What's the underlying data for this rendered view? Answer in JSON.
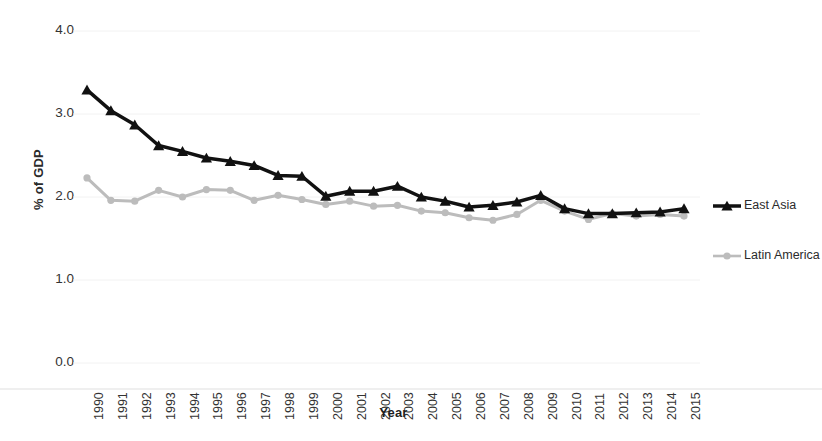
{
  "chart_data": {
    "type": "line",
    "title": "",
    "subtitle": "",
    "xlabel": "Year",
    "ylabel": "% of GDP",
    "xlim": [
      1990,
      2015
    ],
    "ylim": [
      0.0,
      4.0
    ],
    "grid": true,
    "grid_axis": "y",
    "legend_position": "right",
    "y_ticks": [
      "0.0",
      "1.0",
      "2.0",
      "3.0",
      "4.0"
    ],
    "y_tick_values": [
      0.0,
      1.0,
      2.0,
      3.0,
      4.0
    ],
    "categories": [
      "1990",
      "1991",
      "1992",
      "1993",
      "1994",
      "1995",
      "1996",
      "1997",
      "1998",
      "1999",
      "2000",
      "2001",
      "2002",
      "2003",
      "2004",
      "2005",
      "2006",
      "2007",
      "2008",
      "2009",
      "2010",
      "2011",
      "2012",
      "2013",
      "2014",
      "2015"
    ],
    "x": [
      1990,
      1991,
      1992,
      1993,
      1994,
      1995,
      1996,
      1997,
      1998,
      1999,
      2000,
      2001,
      2002,
      2003,
      2004,
      2005,
      2006,
      2007,
      2008,
      2009,
      2010,
      2011,
      2012,
      2013,
      2014,
      2015
    ],
    "series": [
      {
        "name": "East Asia",
        "color": "#111111",
        "marker": "triangle",
        "line_width": 3.5,
        "values": [
          3.29,
          3.04,
          2.87,
          2.62,
          2.55,
          2.47,
          2.43,
          2.38,
          2.26,
          2.25,
          2.01,
          2.07,
          2.07,
          2.13,
          2.0,
          1.95,
          1.88,
          1.9,
          1.94,
          2.02,
          1.86,
          1.8,
          1.8,
          1.81,
          1.82,
          1.86
        ]
      },
      {
        "name": "Latin America",
        "color": "#bcbcbc",
        "marker": "circle",
        "line_width": 3.0,
        "values": [
          2.23,
          1.96,
          1.95,
          2.08,
          2.0,
          2.09,
          2.08,
          1.96,
          2.02,
          1.97,
          1.91,
          1.95,
          1.89,
          1.9,
          1.83,
          1.81,
          1.75,
          1.72,
          1.79,
          1.96,
          1.83,
          1.73,
          1.8,
          1.77,
          1.79,
          1.77
        ]
      }
    ]
  },
  "legend": {
    "entries": [
      {
        "label": "East Asia",
        "color": "#111111",
        "marker": "triangle"
      },
      {
        "label": "Latin America",
        "color": "#bcbcbc",
        "marker": "circle"
      }
    ]
  },
  "axes": {
    "y_title": "% of GDP",
    "x_title": "Year"
  }
}
